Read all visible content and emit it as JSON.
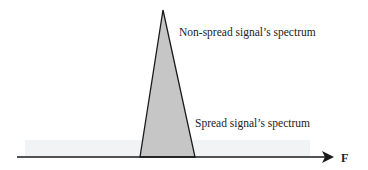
{
  "diagram": {
    "type": "spectrum-comparison",
    "axis": {
      "label": "F"
    },
    "labels": {
      "non_spread": "Non-spread signal’s spectrum",
      "spread": "Spread signal’s spectrum"
    },
    "colors": {
      "narrow_fill": "#c4c4c4",
      "spread_fill": "#f1f3f4",
      "line": "#1a1a1a"
    }
  }
}
